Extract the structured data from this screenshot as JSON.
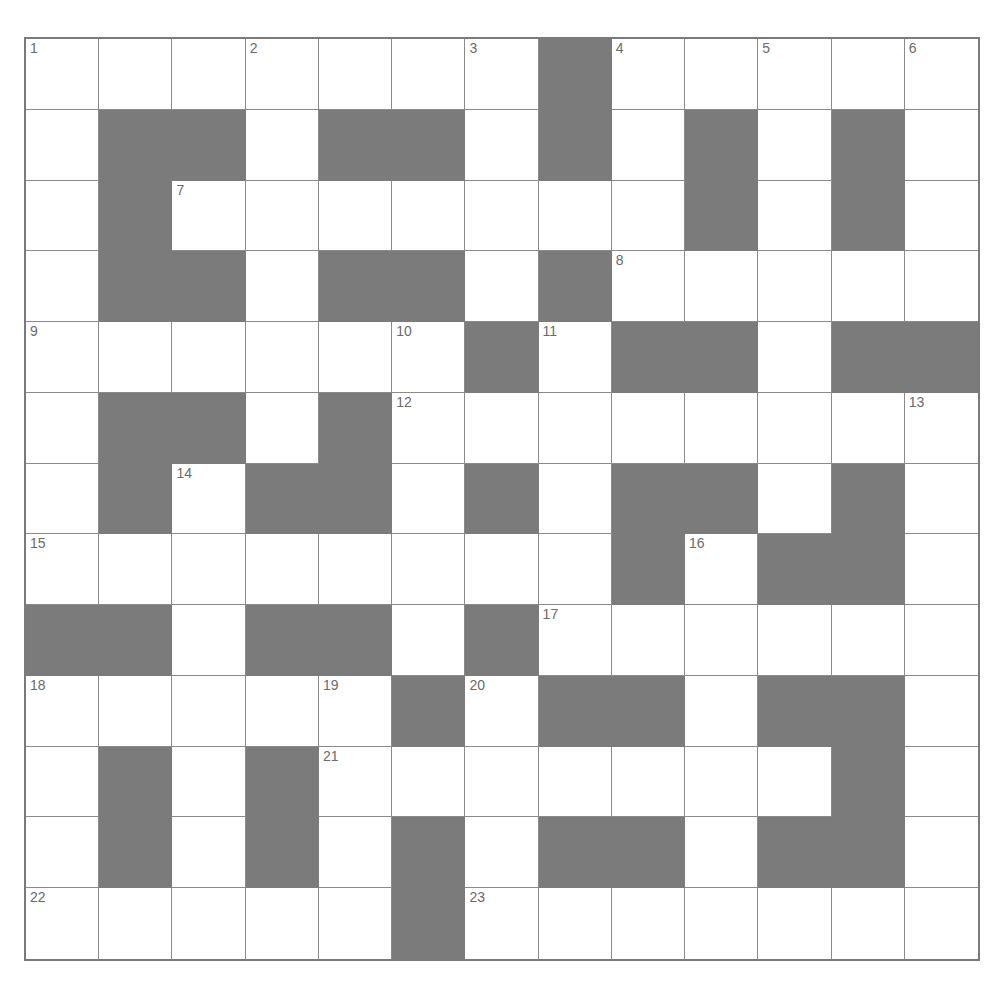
{
  "puzzle": {
    "rows": 13,
    "cols": 13,
    "block_color": "#7b7b7b",
    "line_color": "#8a8a8a",
    "layout": [
      "WWWWWWWBWWWWW",
      "WBBWBBWBWBWBW",
      "WBWWWWWWWBWBW",
      "WBBWBBWBWWWWW",
      "WWWWWWBWBBWBB",
      "WBBWBWWWWWWWW",
      "WBWBBWBWBBWBW",
      "WWWWWWWWBWBBW",
      "BBWBBWBWWWWWW",
      "WWWWWBWBBWBBW",
      "WBWBWWWWWWWBW",
      "WBWBWBWBBWBBW",
      "WWWWWBWWWWWWW"
    ],
    "numbers": [
      {
        "r": 0,
        "c": 0,
        "n": "1"
      },
      {
        "r": 0,
        "c": 3,
        "n": "2"
      },
      {
        "r": 0,
        "c": 6,
        "n": "3"
      },
      {
        "r": 0,
        "c": 8,
        "n": "4"
      },
      {
        "r": 0,
        "c": 10,
        "n": "5"
      },
      {
        "r": 0,
        "c": 12,
        "n": "6"
      },
      {
        "r": 2,
        "c": 2,
        "n": "7"
      },
      {
        "r": 3,
        "c": 8,
        "n": "8"
      },
      {
        "r": 4,
        "c": 0,
        "n": "9"
      },
      {
        "r": 4,
        "c": 5,
        "n": "10"
      },
      {
        "r": 4,
        "c": 7,
        "n": "11"
      },
      {
        "r": 5,
        "c": 5,
        "n": "12"
      },
      {
        "r": 5,
        "c": 12,
        "n": "13"
      },
      {
        "r": 6,
        "c": 2,
        "n": "14"
      },
      {
        "r": 7,
        "c": 0,
        "n": "15"
      },
      {
        "r": 7,
        "c": 9,
        "n": "16"
      },
      {
        "r": 8,
        "c": 7,
        "n": "17"
      },
      {
        "r": 9,
        "c": 0,
        "n": "18"
      },
      {
        "r": 9,
        "c": 4,
        "n": "19"
      },
      {
        "r": 9,
        "c": 6,
        "n": "20"
      },
      {
        "r": 10,
        "c": 4,
        "n": "21"
      },
      {
        "r": 12,
        "c": 0,
        "n": "22"
      },
      {
        "r": 12,
        "c": 6,
        "n": "23"
      }
    ]
  }
}
